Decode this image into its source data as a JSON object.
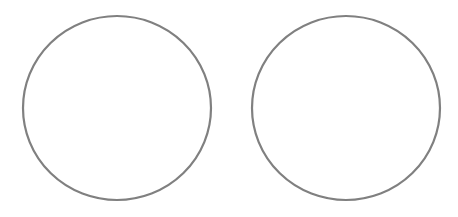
{
  "canvas": {
    "width": 458,
    "height": 217,
    "background": "#ffffff"
  },
  "shapes": [
    {
      "type": "ellipse",
      "name": "left-circle",
      "cx": 117,
      "cy": 108,
      "rx": 94,
      "ry": 92,
      "stroke": "#808080",
      "stroke_width": 2.2,
      "fill": "none"
    },
    {
      "type": "ellipse",
      "name": "right-circle",
      "cx": 346,
      "cy": 108,
      "rx": 94,
      "ry": 92,
      "stroke": "#808080",
      "stroke_width": 2.2,
      "fill": "none"
    }
  ]
}
